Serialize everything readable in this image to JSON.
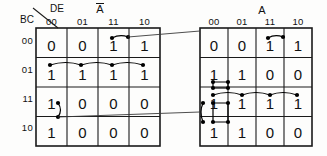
{
  "diagram": {
    "row_axis_label": "BC",
    "col_axis_label": "DE",
    "column_headers": [
      "00",
      "01",
      "11",
      "10"
    ],
    "row_headers": [
      "00",
      "01",
      "11",
      "10"
    ],
    "colors": {
      "grid": "#1a1a1a",
      "text": "#111111",
      "marker": "#000000",
      "connector": "#3a3a3a",
      "background": "#fdfdfc"
    },
    "maps": [
      {
        "name": "left-map",
        "variable_label": "A",
        "variable_overbar": true,
        "cells": [
          [
            "0",
            "0",
            "1",
            "1"
          ],
          [
            "1",
            "1",
            "1",
            "1"
          ],
          [
            "1",
            "0",
            "0",
            "0"
          ],
          [
            "1",
            "0",
            "0",
            "0"
          ]
        ]
      },
      {
        "name": "right-map",
        "variable_label": "A",
        "variable_overbar": false,
        "cells": [
          [
            "0",
            "0",
            "1",
            "1"
          ],
          [
            "1",
            "1",
            "0",
            "0"
          ],
          [
            "1",
            "1",
            "1",
            "1"
          ],
          [
            "1",
            "1",
            "0",
            "0"
          ]
        ]
      }
    ]
  }
}
